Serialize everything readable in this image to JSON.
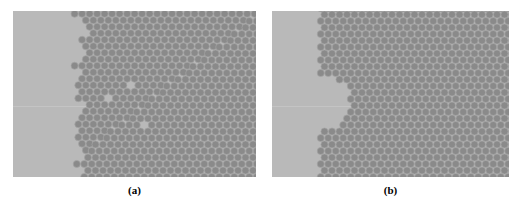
{
  "figure": {
    "type": "scientific-micrograph-pair",
    "background_color": "#ffffff",
    "width": 522,
    "height": 205
  },
  "panels": [
    {
      "id": "a",
      "caption": "(a)",
      "x": 13,
      "y": 11,
      "width": 243,
      "height": 166,
      "substrate_color": "#b9b9b9",
      "particle_color": "#8a8a8a",
      "particle_edge_color": "#a5a5a5",
      "particle_diameter_px": 7.1,
      "lattice_spacing_px": 7.5,
      "lattice_type": "hexagonal-close-packed",
      "crystal_left_edge_px": 66,
      "interface_kind": "rough-irregular",
      "interface_roughness_px": 9,
      "grain_boundary": {
        "present": true,
        "kind": "diagonal-line",
        "start_x_px": 232,
        "start_y_px": 12,
        "end_x_px": 132,
        "end_y_px": 92
      },
      "vacancies": [
        {
          "x_px": 114,
          "y_px": 74
        },
        {
          "x_px": 97,
          "y_px": 86
        },
        {
          "x_px": 128,
          "y_px": 112
        }
      ],
      "scan_line": {
        "present": true,
        "y_px": 95,
        "color": "#c4c4c4"
      }
    },
    {
      "id": "b",
      "caption": "(b)",
      "x": 272,
      "y": 11,
      "width": 237,
      "height": 166,
      "substrate_color": "#b9b9b9",
      "particle_color": "#8a8a8a",
      "particle_edge_color": "#a5a5a5",
      "particle_diameter_px": 7.1,
      "lattice_spacing_px": 7.5,
      "lattice_type": "hexagonal-close-packed",
      "crystal_left_edge_px": 48,
      "interface_kind": "straight-with-concave-notch",
      "notch": {
        "present": true,
        "shape": "semicircular-void",
        "center_y_px": 92,
        "depth_px": 22,
        "radius_px": 26
      },
      "scan_line": {
        "present": true,
        "y_px": 95,
        "color": "#c4c4c4"
      }
    }
  ],
  "captions": {
    "a": "(a)",
    "b": "(b)"
  }
}
